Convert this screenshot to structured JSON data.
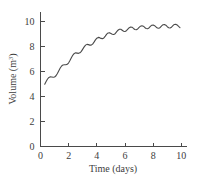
{
  "chart_data": {
    "type": "line",
    "title": "",
    "xlabel": "Time (days)",
    "ylabel_text": "Volume (m",
    "ylabel_sup": "3",
    "ylabel_tail": ")",
    "ylabel": "Volume (m3)",
    "xlim": [
      0,
      10.4
    ],
    "ylim": [
      0,
      10.8
    ],
    "xticks": [
      0,
      2,
      4,
      6,
      8,
      10
    ],
    "xtick_labels": [
      "0",
      "2",
      "4",
      "6",
      "8",
      "10"
    ],
    "yticks": [
      0,
      2,
      4,
      6,
      8,
      10
    ],
    "ytick_labels": [
      "0",
      "2",
      "4",
      "6",
      "8",
      "10"
    ],
    "grid": false,
    "legend": false,
    "line_color": "#4a4a4a",
    "axis_color": "#4a4a4a",
    "background": "#ffffff",
    "series": [
      {
        "name": "Volume",
        "description": "Damped oscillatory growth saturating near 9.6 m^3 with persistent small ripples of period about 0.75 days",
        "x": [
          0.3,
          0.4,
          0.5,
          0.6,
          0.7,
          0.8,
          0.9,
          1.0,
          1.1,
          1.2,
          1.3,
          1.4,
          1.5,
          1.6,
          1.7,
          1.8,
          1.9,
          2.0,
          2.1,
          2.2,
          2.3,
          2.4,
          2.5,
          2.6,
          2.7,
          2.8,
          2.9,
          3.0,
          3.1,
          3.2,
          3.3,
          3.4,
          3.5,
          3.6,
          3.7,
          3.8,
          3.9,
          4.0,
          4.1,
          4.2,
          4.3,
          4.4,
          4.5,
          4.6,
          4.7,
          4.8,
          4.9,
          5.0,
          5.1,
          5.2,
          5.3,
          5.4,
          5.5,
          5.6,
          5.7,
          5.8,
          5.9,
          6.0,
          6.1,
          6.2,
          6.3,
          6.4,
          6.5,
          6.6,
          6.7,
          6.8,
          6.9,
          7.0,
          7.1,
          7.2,
          7.3,
          7.4,
          7.5,
          7.6,
          7.7,
          7.8,
          7.9,
          8.0,
          8.1,
          8.2,
          8.3,
          8.4,
          8.5,
          8.6,
          8.7,
          8.8,
          8.9,
          9.0,
          9.1,
          9.2,
          9.3,
          9.4,
          9.5,
          9.6,
          9.7,
          9.8,
          9.9
        ],
        "y": [
          5.0,
          5.22,
          5.42,
          5.55,
          5.6,
          5.58,
          5.56,
          5.58,
          5.68,
          5.86,
          6.08,
          6.3,
          6.46,
          6.55,
          6.56,
          6.56,
          6.6,
          6.72,
          6.92,
          7.14,
          7.34,
          7.47,
          7.52,
          7.5,
          7.48,
          7.52,
          7.64,
          7.82,
          8.0,
          8.14,
          8.2,
          8.18,
          8.14,
          8.14,
          8.22,
          8.38,
          8.56,
          8.7,
          8.76,
          8.74,
          8.68,
          8.66,
          8.72,
          8.86,
          9.02,
          9.12,
          9.14,
          9.08,
          9.02,
          9.0,
          9.06,
          9.2,
          9.34,
          9.42,
          9.42,
          9.34,
          9.26,
          9.24,
          9.3,
          9.42,
          9.54,
          9.6,
          9.58,
          9.48,
          9.4,
          9.38,
          9.44,
          9.56,
          9.66,
          9.7,
          9.66,
          9.56,
          9.48,
          9.46,
          9.52,
          9.64,
          9.74,
          9.76,
          9.7,
          9.6,
          9.52,
          9.5,
          9.56,
          9.68,
          9.78,
          9.8,
          9.74,
          9.62,
          9.54,
          9.52,
          9.58,
          9.7,
          9.8,
          9.82,
          9.76,
          9.64,
          9.54
        ]
      }
    ],
    "annotations": []
  }
}
